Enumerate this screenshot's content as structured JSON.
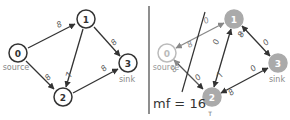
{
  "colors": {
    "edge": "#333333",
    "node_stroke": "#333333",
    "label": "#555555",
    "faded_node": "#aaaaaa",
    "faded_edge": "#999999",
    "divider": "#444444"
  },
  "left_graph": {
    "nodes": [
      {
        "id": "0",
        "label": "0",
        "caption": "source"
      },
      {
        "id": "1",
        "label": "1",
        "caption": ""
      },
      {
        "id": "2",
        "label": "2",
        "caption": ""
      },
      {
        "id": "3",
        "label": "3",
        "caption": "sink"
      }
    ],
    "edges": [
      {
        "from": "0",
        "to": "1",
        "label": "8"
      },
      {
        "from": "0",
        "to": "2",
        "label": "8"
      },
      {
        "from": "1",
        "to": "2",
        "label": "7"
      },
      {
        "from": "1",
        "to": "3",
        "label": "8"
      },
      {
        "from": "2",
        "to": "3",
        "label": "8"
      }
    ]
  },
  "right_graph": {
    "nodes": [
      {
        "id": "0",
        "label": "0",
        "caption": "source",
        "mark": ""
      },
      {
        "id": "1",
        "label": "1",
        "caption": "",
        "mark": "T"
      },
      {
        "id": "2",
        "label": "2",
        "caption": "",
        "mark": "T"
      },
      {
        "id": "3",
        "label": "3",
        "caption": "sink",
        "mark": ""
      }
    ],
    "edges": [
      {
        "from": "0",
        "to": "1",
        "label": "0"
      },
      {
        "from": "1",
        "to": "0",
        "label": "8"
      },
      {
        "from": "0",
        "to": "2",
        "label": "0"
      },
      {
        "from": "2",
        "to": "0",
        "label": "8"
      },
      {
        "from": "1",
        "to": "2",
        "label": "0"
      },
      {
        "from": "2",
        "to": "1",
        "label": "7"
      },
      {
        "from": "1",
        "to": "3",
        "label": "0"
      },
      {
        "from": "3",
        "to": "1",
        "label": "8"
      },
      {
        "from": "2",
        "to": "3",
        "label": "0"
      },
      {
        "from": "3",
        "to": "2",
        "label": "8"
      }
    ],
    "max_flow_text": "mf = 16"
  }
}
